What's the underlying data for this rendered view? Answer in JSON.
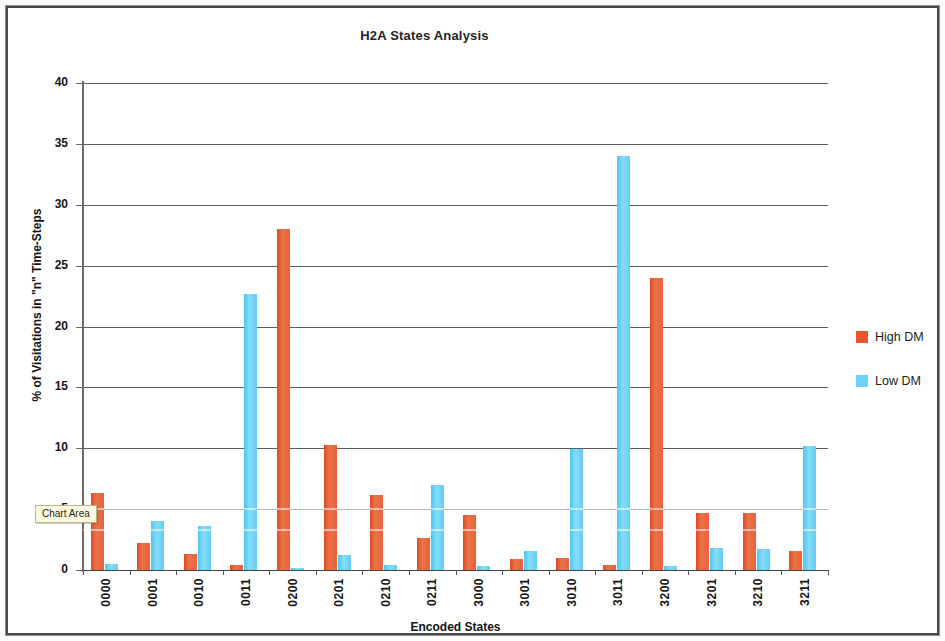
{
  "document": {
    "frame_border_color": "#4a4a4a",
    "background": "#ffffff"
  },
  "chart_area_tooltip": {
    "label": "Chart Area"
  },
  "legend": {
    "position": "right",
    "items": [
      {
        "label": "High DM",
        "color": "#e8552e"
      },
      {
        "label": "Low DM",
        "color": "#6ed2f5"
      }
    ]
  },
  "chart_data": {
    "type": "bar",
    "title": "H2A States Analysis",
    "xlabel": "Encoded States",
    "ylabel": "% of Visitations in \"n\" Time-Steps",
    "ylim": [
      0,
      40
    ],
    "ytick_step": 5,
    "yticks": [
      0,
      5,
      10,
      15,
      20,
      25,
      30,
      35,
      40
    ],
    "ytick_labels": [
      "0",
      "5",
      "10",
      "15",
      "20",
      "25",
      "30",
      "35",
      "40"
    ],
    "grid": true,
    "legend_position": "right",
    "categories": [
      "0000",
      "0001",
      "0010",
      "0011",
      "0200",
      "0201",
      "0210",
      "0211",
      "3000",
      "3001",
      "3010",
      "3011",
      "3200",
      "3201",
      "3210",
      "3211"
    ],
    "series": [
      {
        "name": "High DM",
        "color": "#e8552e",
        "values": [
          6.3,
          2.2,
          1.3,
          0.4,
          28.0,
          10.3,
          6.2,
          2.6,
          4.5,
          0.9,
          1.0,
          0.4,
          24.0,
          4.7,
          4.7,
          1.6
        ]
      },
      {
        "name": "Low DM",
        "color": "#6ed2f5",
        "values": [
          0.5,
          4.0,
          3.6,
          22.7,
          0.2,
          1.2,
          0.4,
          7.0,
          0.3,
          1.6,
          9.9,
          34.0,
          0.3,
          1.8,
          1.7,
          10.2
        ]
      }
    ]
  }
}
